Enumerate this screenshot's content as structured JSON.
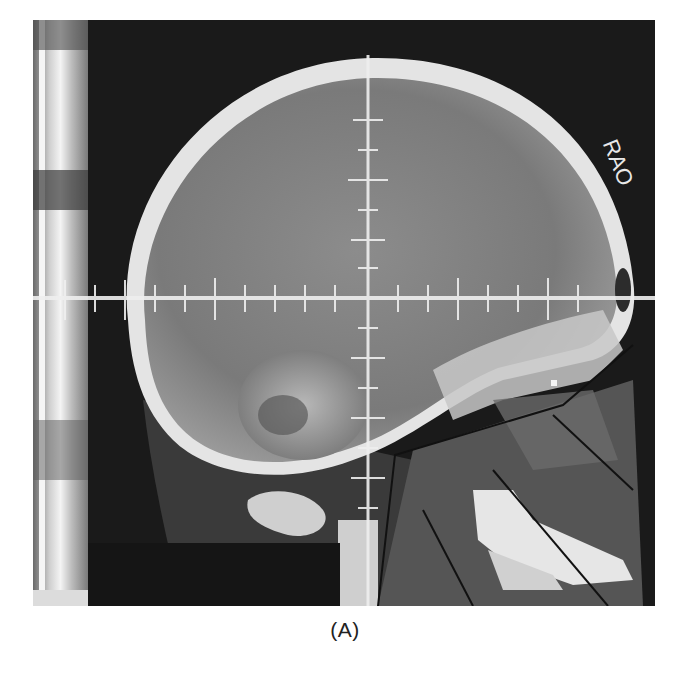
{
  "figure": {
    "panel_label": "(A)",
    "image_description": "Lateral skull radiograph with crosshair graticule and field outline",
    "orientation_marker": "RAO",
    "colors": {
      "background": "#1a1a1a",
      "bone": "#d9d9d9",
      "soft_tissue": "#8a8a8a",
      "graticule": "#efefef",
      "outline": "#111111"
    }
  }
}
